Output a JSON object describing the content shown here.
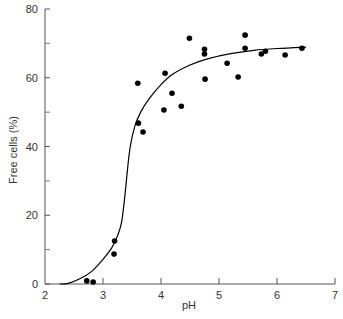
{
  "chart_data": {
    "type": "scatter",
    "title": "",
    "xlabel": "pH",
    "ylabel": "Free cells (%)",
    "xlim": [
      2,
      7
    ],
    "ylim": [
      0,
      80
    ],
    "xticks": [
      2,
      3,
      4,
      5,
      6,
      7
    ],
    "yticks": [
      0,
      20,
      40,
      60,
      80
    ],
    "yminor_ticks": [
      10,
      30,
      50,
      70
    ],
    "grid": false,
    "legend": null,
    "series": [
      {
        "name": "measurements",
        "type": "scatter",
        "color": "#000000",
        "points": [
          [
            2.72,
            0.9
          ],
          [
            2.83,
            0.6
          ],
          [
            3.19,
            8.7
          ],
          [
            3.2,
            12.5
          ],
          [
            3.6,
            58.4
          ],
          [
            3.61,
            46.8
          ],
          [
            3.69,
            44.2
          ],
          [
            4.05,
            50.6
          ],
          [
            4.07,
            61.3
          ],
          [
            4.19,
            55.5
          ],
          [
            4.35,
            51.7
          ],
          [
            4.49,
            71.5
          ],
          [
            4.75,
            68.3
          ],
          [
            4.75,
            66.9
          ],
          [
            4.76,
            59.6
          ],
          [
            5.14,
            64.2
          ],
          [
            5.33,
            60.2
          ],
          [
            5.45,
            72.4
          ],
          [
            5.45,
            68.6
          ],
          [
            5.73,
            66.9
          ],
          [
            5.8,
            67.7
          ],
          [
            6.14,
            66.6
          ],
          [
            6.43,
            68.6
          ]
        ]
      },
      {
        "name": "fitted curve",
        "type": "line",
        "color": "#000000",
        "points": [
          [
            2.25,
            0
          ],
          [
            2.4,
            0.2
          ],
          [
            2.6,
            1.5
          ],
          [
            2.8,
            3.6
          ],
          [
            3.0,
            7.2
          ],
          [
            3.15,
            10.5
          ],
          [
            3.25,
            14
          ],
          [
            3.32,
            18
          ],
          [
            3.38,
            26
          ],
          [
            3.42,
            33
          ],
          [
            3.47,
            40
          ],
          [
            3.55,
            46
          ],
          [
            3.65,
            50
          ],
          [
            3.8,
            54
          ],
          [
            4.0,
            58
          ],
          [
            4.2,
            61
          ],
          [
            4.5,
            63.7
          ],
          [
            4.8,
            65.5
          ],
          [
            5.2,
            67
          ],
          [
            5.6,
            68
          ],
          [
            6.0,
            68.5
          ],
          [
            6.5,
            68.9
          ]
        ]
      }
    ]
  },
  "axes": {
    "x_label": "pH",
    "y_label": "Free cells (%)"
  }
}
